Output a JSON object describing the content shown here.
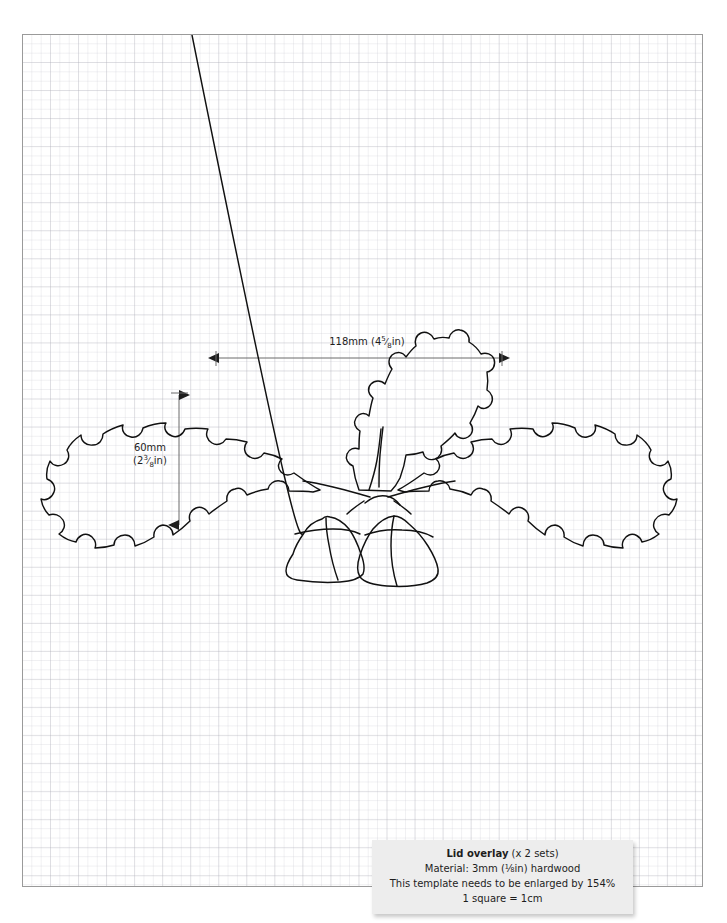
{
  "page": {
    "kind": "woodworking-template-sheet",
    "grid_note": "1 square = 1cm"
  },
  "dimensions": {
    "horizontal": {
      "metric": "118mm",
      "imperial_whole": "4",
      "imperial_num": "5",
      "imperial_den": "8",
      "imperial_unit": "in",
      "full": "118mm (4⅝in)"
    },
    "vertical": {
      "metric": "60mm",
      "imperial_whole": "2",
      "imperial_num": "3",
      "imperial_den": "8",
      "imperial_unit": "in",
      "full": "60mm (2⅜in)"
    }
  },
  "artwork": {
    "name": "oak-leaf-and-acorn-motif",
    "stroke_color": "#111111",
    "fill_color": "none",
    "elements": [
      "left-oak-leaf",
      "right-oak-leaf",
      "center-upright-oak-leaf",
      "left-acorn",
      "right-acorn",
      "stems"
    ]
  },
  "caption": {
    "title": "Lid overlay",
    "title_suffix": "(x 2 sets)",
    "material": "Material:  3mm (⅛in) hardwood",
    "enlarge": "This template needs to be enlarged by 154%",
    "scale": "1 square = 1cm"
  },
  "colors": {
    "sheet_border": "#9a9a9a",
    "grid_minor": "#cdcdd4",
    "grid_major": "#aaaab4",
    "ink": "#111111",
    "caption_bg": "#ededed"
  }
}
